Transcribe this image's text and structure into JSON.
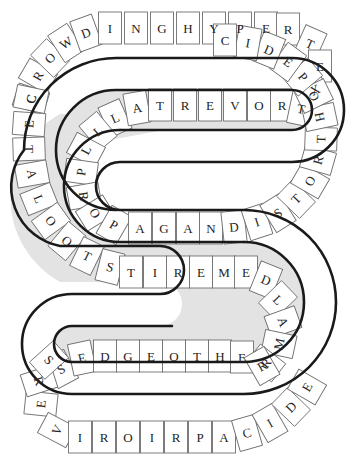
{
  "puzzle": {
    "title": "Word Snake",
    "shape": "S-curve serpentine band",
    "colors": {
      "background": "#ffffff",
      "cell_fill": "#ffffff",
      "band_fill": "#e3e3e3",
      "outline": "#1a1a1a",
      "cell_stroke": "#6f6f6f",
      "letter": "#242424"
    },
    "rows": {
      "top_outer": {
        "label": "top outer track",
        "letters": [
          "C",
          "R",
          "O",
          "W",
          "D",
          "I",
          "N",
          "G",
          "H",
          "Y",
          "P",
          "E",
          "R",
          "T",
          "E",
          "X"
        ]
      },
      "row_two": {
        "label": "second track",
        "letters": [
          "A",
          "L",
          "T",
          "R",
          "E",
          "V",
          "O",
          "R",
          "T"
        ]
      },
      "inner_left_curve": {
        "label": "inner left curve",
        "letters": [
          "L",
          "L",
          "P",
          "R",
          "O",
          "P"
        ]
      },
      "row_three": {
        "label": "third track",
        "letters": [
          "A",
          "G",
          "A",
          "N",
          "D",
          "I",
          "S",
          "T",
          "O",
          "R",
          "T",
          "H",
          "O",
          "P",
          "E",
          "D",
          "I",
          "C"
        ]
      },
      "left_outer": {
        "label": "left outer track",
        "letters": [
          "C",
          "E",
          "T",
          "A",
          "L",
          "O",
          "O",
          "T",
          "S"
        ]
      },
      "row_four": {
        "label": "fourth track",
        "letters": [
          "T",
          "I",
          "R",
          "E",
          "M",
          "E",
          "D",
          "L",
          "A",
          "M",
          "R"
        ]
      },
      "bottom_inner": {
        "label": "bottom inner track",
        "letters": [
          "S",
          "E",
          "D",
          "G",
          "E",
          "O",
          "T",
          "H",
          "E",
          "R"
        ]
      },
      "bottom_outer": {
        "label": "bottom outer track",
        "letters": [
          "E",
          "R",
          "E",
          "V",
          "I",
          "R",
          "O",
          "I",
          "R",
          "P",
          "A",
          "C",
          "I",
          "D",
          "E"
        ]
      }
    },
    "letters": {
      "top_outer": [
        {
          "ch": "C",
          "x": 31,
          "y": 99,
          "rot": -72
        },
        {
          "ch": "R",
          "x": 38,
          "y": 76,
          "rot": -60
        },
        {
          "ch": "O",
          "x": 50,
          "y": 58,
          "rot": -46
        },
        {
          "ch": "W",
          "x": 66,
          "y": 43,
          "rot": -33
        },
        {
          "ch": "D",
          "x": 86,
          "y": 33,
          "rot": -20
        },
        {
          "ch": "I",
          "x": 110,
          "y": 28,
          "rot": 0
        },
        {
          "ch": "N",
          "x": 136,
          "y": 28,
          "rot": 0
        },
        {
          "ch": "G",
          "x": 162,
          "y": 28,
          "rot": 0
        },
        {
          "ch": "H",
          "x": 188,
          "y": 28,
          "rot": 0
        },
        {
          "ch": "Y",
          "x": 214,
          "y": 28,
          "rot": 0
        },
        {
          "ch": "P",
          "x": 240,
          "y": 28,
          "rot": 0
        },
        {
          "ch": "E",
          "x": 266,
          "y": 28,
          "rot": 0
        },
        {
          "ch": "R",
          "x": 288,
          "y": 29,
          "rot": 0
        },
        {
          "ch": "T",
          "x": 310,
          "y": 44,
          "rot": 24
        },
        {
          "ch": "E",
          "x": 320,
          "y": 66,
          "rot": 0
        },
        {
          "ch": "X",
          "x": 315,
          "y": 90,
          "rot": -26
        }
      ],
      "row_two": [
        {
          "ch": "L",
          "x": 115,
          "y": 118,
          "rot": -24
        },
        {
          "ch": "A",
          "x": 137,
          "y": 108,
          "rot": -10
        },
        {
          "ch": "T",
          "x": 160,
          "y": 105,
          "rot": 0
        },
        {
          "ch": "R",
          "x": 185,
          "y": 105,
          "rot": 0
        },
        {
          "ch": "E",
          "x": 210,
          "y": 105,
          "rot": 0
        },
        {
          "ch": "V",
          "x": 235,
          "y": 105,
          "rot": 0
        },
        {
          "ch": "O",
          "x": 259,
          "y": 105,
          "rot": 0
        },
        {
          "ch": "R",
          "x": 282,
          "y": 105,
          "rot": 0
        },
        {
          "ch": "T",
          "x": 301,
          "y": 109,
          "rot": 12
        }
      ],
      "inner_left_curve": [
        {
          "ch": "L",
          "x": 98,
          "y": 131,
          "rot": -40
        },
        {
          "ch": "L",
          "x": 86,
          "y": 150,
          "rot": -62
        },
        {
          "ch": "P",
          "x": 81,
          "y": 172,
          "rot": -82
        },
        {
          "ch": "R",
          "x": 84,
          "y": 196,
          "rot": 80
        },
        {
          "ch": "O",
          "x": 95,
          "y": 213,
          "rot": 58
        },
        {
          "ch": "P",
          "x": 114,
          "y": 225,
          "rot": 30
        }
      ],
      "row_three": [
        {
          "ch": "A",
          "x": 140,
          "y": 228,
          "rot": 0
        },
        {
          "ch": "G",
          "x": 164,
          "y": 228,
          "rot": 0
        },
        {
          "ch": "A",
          "x": 188,
          "y": 228,
          "rot": 0
        },
        {
          "ch": "N",
          "x": 211,
          "y": 228,
          "rot": 0
        },
        {
          "ch": "D",
          "x": 234,
          "y": 227,
          "rot": -6
        },
        {
          "ch": "I",
          "x": 257,
          "y": 222,
          "rot": -18
        },
        {
          "ch": "S",
          "x": 278,
          "y": 213,
          "rot": -32
        },
        {
          "ch": "T",
          "x": 296,
          "y": 199,
          "rot": -46
        },
        {
          "ch": "O",
          "x": 310,
          "y": 181,
          "rot": -60
        },
        {
          "ch": "R",
          "x": 318,
          "y": 160,
          "rot": -74
        },
        {
          "ch": "T",
          "x": 321,
          "y": 139,
          "rot": -88
        },
        {
          "ch": "H",
          "x": 320,
          "y": 117,
          "rot": 78
        },
        {
          "ch": "O",
          "x": 314,
          "y": 96,
          "rot": 64
        },
        {
          "ch": "P",
          "x": 303,
          "y": 77,
          "rot": 50
        },
        {
          "ch": "E",
          "x": 288,
          "y": 62,
          "rot": 36
        },
        {
          "ch": "D",
          "x": 269,
          "y": 50,
          "rot": 22
        },
        {
          "ch": "I",
          "x": 248,
          "y": 43,
          "rot": 10
        },
        {
          "ch": "C",
          "x": 225,
          "y": 40,
          "rot": 0
        }
      ],
      "left_outer": [
        {
          "ch": "C",
          "x": 31,
          "y": 99,
          "rot": -78
        },
        {
          "ch": "E",
          "x": 29,
          "y": 124,
          "rot": -86
        },
        {
          "ch": "T",
          "x": 29,
          "y": 149,
          "rot": 88
        },
        {
          "ch": "A",
          "x": 32,
          "y": 174,
          "rot": 80
        },
        {
          "ch": "L",
          "x": 39,
          "y": 199,
          "rot": 68
        },
        {
          "ch": "O",
          "x": 51,
          "y": 221,
          "rot": 54
        },
        {
          "ch": "O",
          "x": 67,
          "y": 241,
          "rot": 40
        },
        {
          "ch": "T",
          "x": 87,
          "y": 256,
          "rot": 26
        },
        {
          "ch": "S",
          "x": 110,
          "y": 267,
          "rot": 14
        }
      ],
      "row_four": [
        {
          "ch": "T",
          "x": 131,
          "y": 272,
          "rot": 0
        },
        {
          "ch": "I",
          "x": 155,
          "y": 272,
          "rot": 0
        },
        {
          "ch": "R",
          "x": 178,
          "y": 272,
          "rot": 0
        },
        {
          "ch": "E",
          "x": 201,
          "y": 272,
          "rot": 0
        },
        {
          "ch": "M",
          "x": 224,
          "y": 272,
          "rot": 0
        },
        {
          "ch": "E",
          "x": 246,
          "y": 272,
          "rot": 0
        },
        {
          "ch": "D",
          "x": 266,
          "y": 280,
          "rot": 22
        },
        {
          "ch": "L",
          "x": 278,
          "y": 300,
          "rot": 46
        },
        {
          "ch": "A",
          "x": 283,
          "y": 322,
          "rot": 70
        },
        {
          "ch": "M",
          "x": 279,
          "y": 344,
          "rot": -78
        },
        {
          "ch": "R",
          "x": 266,
          "y": 363,
          "rot": -52
        }
      ],
      "bottom_inner": [
        {
          "ch": "S",
          "x": 61,
          "y": 369,
          "rot": -28
        },
        {
          "ch": "E",
          "x": 82,
          "y": 358,
          "rot": -12
        },
        {
          "ch": "D",
          "x": 105,
          "y": 356,
          "rot": 0
        },
        {
          "ch": "G",
          "x": 128,
          "y": 356,
          "rot": 0
        },
        {
          "ch": "E",
          "x": 151,
          "y": 356,
          "rot": 0
        },
        {
          "ch": "O",
          "x": 174,
          "y": 356,
          "rot": 0
        },
        {
          "ch": "T",
          "x": 197,
          "y": 356,
          "rot": 0
        },
        {
          "ch": "H",
          "x": 220,
          "y": 356,
          "rot": 0
        },
        {
          "ch": "E",
          "x": 242,
          "y": 357,
          "rot": 0
        },
        {
          "ch": "R",
          "x": 262,
          "y": 366,
          "rot": -30
        }
      ],
      "bottom_outer": [
        {
          "ch": "E",
          "x": 41,
          "y": 404,
          "rot": -84
        },
        {
          "ch": "R",
          "x": 39,
          "y": 381,
          "rot": 72
        },
        {
          "ch": "S",
          "x": 49,
          "y": 360,
          "rot": 48
        },
        {
          "ch": "V",
          "x": 57,
          "y": 430,
          "rot": -62
        },
        {
          "ch": "I",
          "x": 80,
          "y": 437,
          "rot": 0
        },
        {
          "ch": "R",
          "x": 104,
          "y": 437,
          "rot": 0
        },
        {
          "ch": "O",
          "x": 128,
          "y": 437,
          "rot": 0
        },
        {
          "ch": "I",
          "x": 152,
          "y": 437,
          "rot": 0
        },
        {
          "ch": "R",
          "x": 176,
          "y": 437,
          "rot": 0
        },
        {
          "ch": "P",
          "x": 200,
          "y": 437,
          "rot": 0
        },
        {
          "ch": "A",
          "x": 224,
          "y": 437,
          "rot": 0
        },
        {
          "ch": "C",
          "x": 247,
          "y": 433,
          "rot": -16
        },
        {
          "ch": "I",
          "x": 270,
          "y": 423,
          "rot": -30
        },
        {
          "ch": "D",
          "x": 291,
          "y": 407,
          "rot": -46
        },
        {
          "ch": "E",
          "x": 307,
          "y": 387,
          "rot": -60
        }
      ]
    },
    "bands": {
      "band1": "M 40,150 A 76,76 0 0 1 116,74 L 292,74 A 36,36 0 0 1 292,146 L 120,146 A 40,40 0 0 0 120,226 L 244,226 A 76,76 0 0 1 244,378 L 72,378 A 34,34 0 0 1 72,310",
      "outer_path": "M 24,150 A 92,92 0 0 1 116,58 L 292,58 A 52,52 0 0 1 292,162 L 120,162 A 24,24 0 0 0 120,210 L 244,210 A 92,92 0 0 1 244,394 L 72,394 A 50,50 0 0 1 72,294",
      "inner_path": "M 56,150 A 60,60 0 0 1 116,90 L 292,90 A 20,20 0 0 1 292,130 L 120,130 A 56,56 0 0 0 120,242 L 244,242 A 60,60 0 0 1 244,362 L 72,362 A 18,18 0 0 1 72,326"
    },
    "dividers_note": "radial/vertical cell divider lines between adjacent letter cells"
  }
}
